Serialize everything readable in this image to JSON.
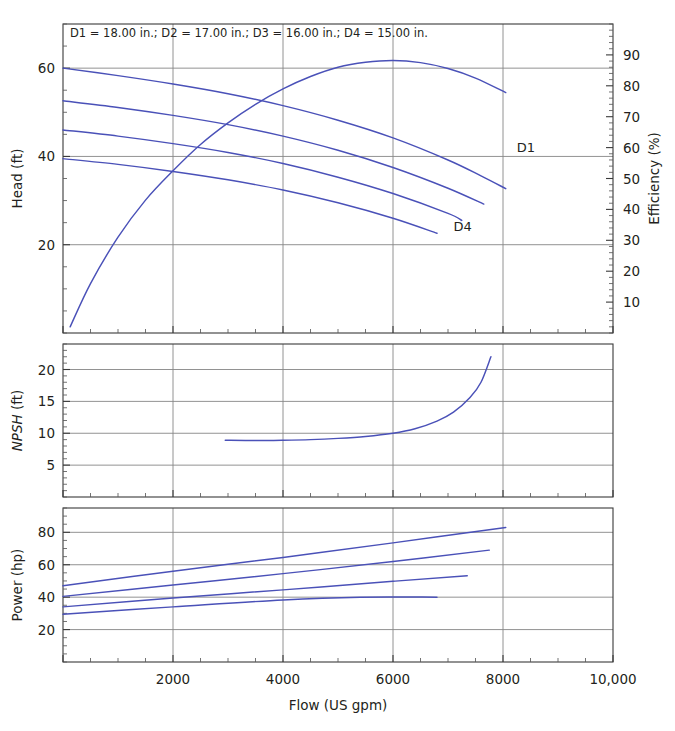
{
  "figure": {
    "note": "D1 = 18.00 in.; D2 = 17.00 in.; D3 = 16.00 in.; D4 = 15.00 in.",
    "curve_labels": {
      "d1": "D1",
      "d4": "D4"
    },
    "line_color": "#4a51b8",
    "grid_color": "#868686",
    "axis_color": "#3a3a3a",
    "background": "#ffffff"
  },
  "chart_data": [
    {
      "type": "line",
      "title": "",
      "panel": "head-efficiency",
      "xlabel": "Flow (US gpm)",
      "ylabel": "Head (ft)",
      "y2label": "Efficiency (%)",
      "xlim": [
        0,
        10000
      ],
      "ylim": [
        0,
        70
      ],
      "y2lim": [
        0,
        100
      ],
      "xticks": [
        0,
        2000,
        4000,
        6000,
        8000,
        10000
      ],
      "xticklabels": [
        "",
        "2000",
        "4000",
        "6000",
        "8000",
        "10,000"
      ],
      "yticks": [
        20,
        40,
        60
      ],
      "yticklabels": [
        "20",
        "40",
        "60"
      ],
      "y2ticks": [
        10,
        20,
        30,
        40,
        50,
        60,
        70,
        80,
        90
      ],
      "y2ticklabels": [
        "10",
        "20",
        "30",
        "40",
        "50",
        "60",
        "70",
        "80",
        "90"
      ],
      "grid": true,
      "legend": "none",
      "annotations": [
        {
          "text": "D1 = 18.00 in.; D2 = 17.00 in.; D3 = 16.00 in.; D4 = 15.00 in.",
          "x": 250,
          "y": 68
        },
        {
          "text": "D1",
          "x": 8250,
          "y": 41
        },
        {
          "text": "D4",
          "x": 7100,
          "y": 23
        }
      ],
      "series": [
        {
          "name": "D1 head",
          "axis": "left",
          "x": [
            0,
            1000,
            2000,
            3000,
            4000,
            5000,
            6000,
            7000,
            7600,
            8050
          ],
          "values": [
            60.0,
            58.3,
            56.4,
            54.2,
            51.5,
            48.2,
            44.2,
            39.2,
            35.6,
            32.7
          ]
        },
        {
          "name": "D2 head",
          "axis": "left",
          "x": [
            0,
            1000,
            2000,
            3000,
            4000,
            5000,
            6000,
            7000,
            7650
          ],
          "values": [
            52.6,
            51.1,
            49.3,
            47.2,
            44.6,
            41.4,
            37.5,
            32.8,
            29.2
          ]
        },
        {
          "name": "D3 head",
          "axis": "left",
          "x": [
            0,
            1000,
            2000,
            3000,
            4000,
            5000,
            6000,
            7000,
            7250
          ],
          "values": [
            46.0,
            44.6,
            42.9,
            40.9,
            38.4,
            35.3,
            31.6,
            27.1,
            25.5
          ]
        },
        {
          "name": "D4 head",
          "axis": "left",
          "x": [
            0,
            1000,
            2000,
            3000,
            4000,
            5000,
            6000,
            6800
          ],
          "values": [
            39.5,
            38.2,
            36.6,
            34.7,
            32.4,
            29.5,
            26.0,
            22.6
          ]
        },
        {
          "name": "Efficiency",
          "axis": "right",
          "x": [
            130,
            500,
            1000,
            1500,
            2000,
            2500,
            3000,
            3500,
            4000,
            4500,
            5000,
            5500,
            6000,
            6500,
            7000,
            7500,
            8050
          ],
          "values": [
            2.0,
            16.0,
            31.0,
            43.0,
            52.5,
            61.0,
            68.0,
            74.0,
            79.0,
            83.0,
            86.0,
            87.6,
            88.2,
            87.5,
            85.6,
            82.5,
            77.8
          ]
        }
      ]
    },
    {
      "type": "line",
      "title": "",
      "panel": "npsh",
      "xlabel": "",
      "ylabel": "NPSH (ft)",
      "xlim": [
        0,
        10000
      ],
      "ylim": [
        0,
        24
      ],
      "xticks": [
        0,
        2000,
        4000,
        6000,
        8000,
        10000
      ],
      "yticks": [
        5,
        10,
        15,
        20
      ],
      "yticklabels": [
        "5",
        "10",
        "15",
        "20"
      ],
      "grid": true,
      "legend": "none",
      "series": [
        {
          "name": "NPSH required",
          "x": [
            2950,
            3500,
            4000,
            4500,
            5000,
            5500,
            6000,
            6400,
            6800,
            7100,
            7400,
            7600,
            7780
          ],
          "values": [
            8.9,
            8.85,
            8.9,
            9.0,
            9.2,
            9.5,
            10.0,
            10.7,
            11.9,
            13.3,
            15.6,
            18.0,
            22.0
          ]
        }
      ]
    },
    {
      "type": "line",
      "title": "",
      "panel": "power",
      "xlabel": "Flow (US gpm)",
      "ylabel": "Power (hp)",
      "xlim": [
        0,
        10000
      ],
      "ylim": [
        0,
        95
      ],
      "xticks": [
        0,
        2000,
        4000,
        6000,
        8000,
        10000
      ],
      "xticklabels": [
        "",
        "2000",
        "4000",
        "6000",
        "8000",
        "10,000"
      ],
      "yticks": [
        20,
        40,
        60,
        80
      ],
      "yticklabels": [
        "20",
        "40",
        "60",
        "80"
      ],
      "grid": true,
      "legend": "none",
      "series": [
        {
          "name": "D1 power",
          "x": [
            0,
            2000,
            4000,
            6000,
            8050
          ],
          "values": [
            47.0,
            56.0,
            64.5,
            73.5,
            83.0
          ]
        },
        {
          "name": "D2 power",
          "x": [
            0,
            2000,
            4000,
            6000,
            7750
          ],
          "values": [
            40.5,
            47.5,
            54.5,
            62.0,
            69.0
          ]
        },
        {
          "name": "D3 power",
          "x": [
            0,
            2000,
            4000,
            6000,
            7350
          ],
          "values": [
            34.0,
            39.5,
            44.5,
            49.8,
            53.2
          ]
        },
        {
          "name": "D4 power",
          "x": [
            0,
            2000,
            4000,
            5400,
            6800
          ],
          "values": [
            29.5,
            34.0,
            38.3,
            40.0,
            40.0
          ]
        }
      ]
    }
  ]
}
